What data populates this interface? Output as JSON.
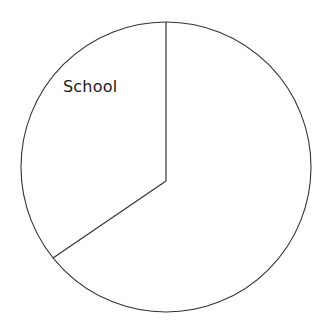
{
  "chart_data": {
    "type": "pie",
    "title": "",
    "subtitle": "",
    "xlabel": "",
    "ylabel": "",
    "grid": false,
    "legend_position": "none",
    "labels_inside": true,
    "categories": [
      "School",
      "",
      ""
    ],
    "values": [
      40,
      25,
      35
    ],
    "series": [
      {
        "name": "Share of circle",
        "values": [
          40,
          25,
          35
        ]
      }
    ],
    "slices": [
      {
        "label": "School",
        "value": 40,
        "percent": 40,
        "sweep_degrees": 146,
        "start_angle_degrees": 90,
        "end_angle_degrees": 236,
        "fill": "#ffffff",
        "stroke": "#333333",
        "labeled": true
      },
      {
        "label": "",
        "value": 25,
        "percent": 25,
        "sweep_degrees": 90,
        "start_angle_degrees": 236,
        "end_angle_degrees": 326,
        "fill": "#ffffff",
        "stroke": "#333333",
        "labeled": false
      },
      {
        "label": "",
        "value": 35,
        "percent": 35,
        "sweep_degrees": 124,
        "start_angle_degrees": 326,
        "end_angle_degrees": 450,
        "fill": "#ffffff",
        "stroke": "#333333",
        "labeled": false
      }
    ],
    "annotations": [
      {
        "text": "School",
        "x": 63,
        "y": 92
      }
    ],
    "geometry": {
      "center_x": 166,
      "center_y": 167,
      "radius": 145,
      "vertex_x": 166,
      "vertex_y": 181,
      "radius_top_end_x": 166,
      "radius_top_end_y": 22,
      "radius_lower_left_end_x": 53,
      "radius_lower_left_end_y": 258
    },
    "colors": {
      "background": "#ffffff",
      "outline": "#333333",
      "divider": "#333333",
      "label_text": "#1a1a1a",
      "slice_fill": "#ffffff"
    }
  },
  "figure": {
    "label_school": "School"
  }
}
